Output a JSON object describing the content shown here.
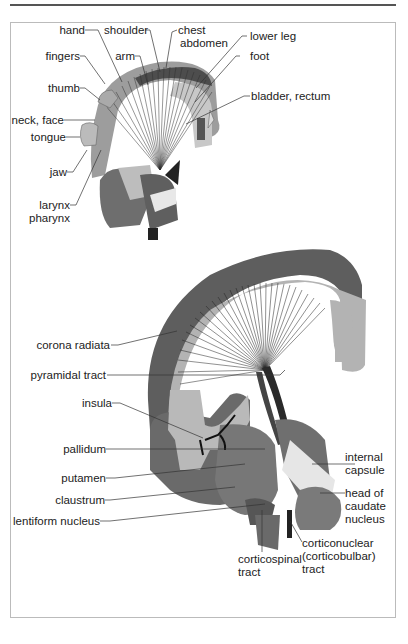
{
  "figure": {
    "top_diagram": {
      "description": "Somatotopic organization of motor cortex projecting into internal capsule",
      "labels": {
        "hand": "hand",
        "shoulder": "shoulder",
        "chest": "chest",
        "abdomen": "abdomen",
        "lower_leg": "lower leg",
        "fingers": "fingers",
        "arm": "arm",
        "foot": "foot",
        "thumb": "thumb",
        "bladder_rectum": "bladder, rectum",
        "neck_face": "neck, face",
        "tongue": "tongue",
        "jaw": "jaw",
        "larynx": "larynx",
        "pharynx": "pharynx"
      }
    },
    "bottom_diagram": {
      "description": "Course of pyramidal tract through corona radiata and internal capsule",
      "labels": {
        "corona_radiata": "corona radiata",
        "pyramidal_tract": "pyramidal tract",
        "insula": "insula",
        "pallidum": "pallidum",
        "putamen": "putamen",
        "claustrum": "claustrum",
        "lentiform_nucleus": "lentiform nucleus",
        "internal_capsule_1": "internal",
        "internal_capsule_2": "capsule",
        "head_of_caudate_1": "head of",
        "head_of_caudate_2": "caudate",
        "head_of_caudate_3": "nucleus",
        "corticospinal_1": "corticospinal",
        "corticospinal_2": "tract",
        "corticonuclear_1": "corticonuclear",
        "corticonuclear_2": "(corticobulbar)",
        "corticonuclear_3": "tract"
      }
    },
    "colors": {
      "cortex_dark": "#5a5a5a",
      "white_matter": "#b3b3b3",
      "nucleus_mid": "#7a7a7a",
      "capsule_light": "#e6e6e6",
      "label_text": "#222222"
    }
  }
}
